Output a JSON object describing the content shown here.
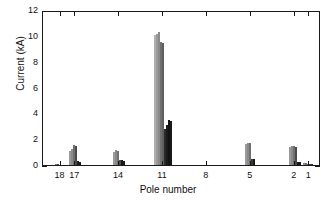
{
  "chart_data": {
    "type": "bar",
    "title": "",
    "xlabel": "Pole number",
    "ylabel": "Current (kA)",
    "ylim": [
      0,
      12
    ],
    "yticks": [
      0,
      2,
      4,
      6,
      8,
      10,
      12
    ],
    "ytick_labels": [
      "0",
      "2",
      "4",
      "6",
      "8",
      "10",
      "12"
    ],
    "xtick_labels": [
      "18",
      "17",
      "14",
      "11",
      "8",
      "5",
      "2",
      "1"
    ],
    "xtick_positions": [
      18,
      17,
      14,
      11,
      8,
      5,
      2,
      1
    ],
    "xlim": [
      19.2,
      0.2
    ],
    "grid": false,
    "legend": null,
    "axis_direction": "x decreasing left to right",
    "bars": [
      {
        "pole": 18.3,
        "value": 0.08,
        "color": "#707070"
      },
      {
        "pole": 18.16,
        "value": 0.1,
        "color": "#555555"
      },
      {
        "pole": 17.34,
        "value": 1.12,
        "color": "#9a9a9a"
      },
      {
        "pole": 17.2,
        "value": 1.22,
        "color": "#8a8a8a"
      },
      {
        "pole": 17.06,
        "value": 1.52,
        "color": "#707070"
      },
      {
        "pole": 16.92,
        "value": 1.5,
        "color": "#4a4a4a"
      },
      {
        "pole": 16.78,
        "value": 0.28,
        "color": "#1a1a1a"
      },
      {
        "pole": 16.64,
        "value": 0.22,
        "color": "#1a1a1a"
      },
      {
        "pole": 14.34,
        "value": 1.02,
        "color": "#9a9a9a"
      },
      {
        "pole": 14.2,
        "value": 1.18,
        "color": "#8a8a8a"
      },
      {
        "pole": 14.06,
        "value": 1.12,
        "color": "#707070"
      },
      {
        "pole": 13.92,
        "value": 0.42,
        "color": "#4a4a4a"
      },
      {
        "pole": 13.78,
        "value": 0.38,
        "color": "#1a1a1a"
      },
      {
        "pole": 13.64,
        "value": 0.3,
        "color": "#1a1a1a"
      },
      {
        "pole": 11.55,
        "value": 10.1,
        "color": "#b0b0b0"
      },
      {
        "pole": 11.41,
        "value": 10.18,
        "color": "#9a9a9a"
      },
      {
        "pole": 11.27,
        "value": 10.32,
        "color": "#8a8a8a"
      },
      {
        "pole": 11.13,
        "value": 9.52,
        "color": "#707070"
      },
      {
        "pole": 10.99,
        "value": 9.46,
        "color": "#606060"
      },
      {
        "pole": 10.85,
        "value": 2.82,
        "color": "#2a2a2a"
      },
      {
        "pole": 10.71,
        "value": 3.12,
        "color": "#1a1a1a"
      },
      {
        "pole": 10.57,
        "value": 3.46,
        "color": "#111111"
      },
      {
        "pole": 10.43,
        "value": 3.42,
        "color": "#1a1a1a"
      },
      {
        "pole": 5.34,
        "value": 1.62,
        "color": "#9a9a9a"
      },
      {
        "pole": 5.2,
        "value": 1.7,
        "color": "#8a8a8a"
      },
      {
        "pole": 5.06,
        "value": 1.68,
        "color": "#707070"
      },
      {
        "pole": 4.92,
        "value": 0.48,
        "color": "#3a3a3a"
      },
      {
        "pole": 4.78,
        "value": 0.46,
        "color": "#1a1a1a"
      },
      {
        "pole": 2.34,
        "value": 1.4,
        "color": "#9a9a9a"
      },
      {
        "pole": 2.2,
        "value": 1.48,
        "color": "#8a8a8a"
      },
      {
        "pole": 2.06,
        "value": 1.46,
        "color": "#707070"
      },
      {
        "pole": 1.92,
        "value": 1.42,
        "color": "#4a4a4a"
      },
      {
        "pole": 1.78,
        "value": 0.24,
        "color": "#1a1a1a"
      },
      {
        "pole": 1.64,
        "value": 0.22,
        "color": "#1a1a1a"
      },
      {
        "pole": 1.36,
        "value": 0.14,
        "color": "#8a8a8a"
      },
      {
        "pole": 1.22,
        "value": 0.12,
        "color": "#707070"
      },
      {
        "pole": 1.08,
        "value": 0.1,
        "color": "#555555"
      },
      {
        "pole": 0.94,
        "value": 0.09,
        "color": "#3a3a3a"
      },
      {
        "pole": 0.8,
        "value": 0.08,
        "color": "#2a2a2a"
      }
    ]
  }
}
